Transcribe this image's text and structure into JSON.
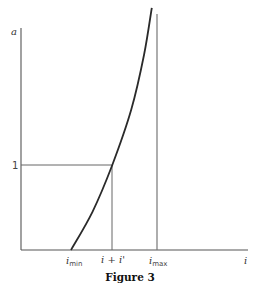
{
  "chart_data": {
    "type": "line",
    "title": "",
    "caption": "Figure 3",
    "xlabel": "i",
    "ylabel": "a",
    "grid": false,
    "legend": "none",
    "x_ticks": [
      {
        "label": "i",
        "sub": "min",
        "value": "i_min"
      },
      {
        "label": "i + i'",
        "sub": "",
        "value": "i + i'"
      },
      {
        "label": "i",
        "sub": "max",
        "value": "i_max"
      }
    ],
    "y_ticks": [
      {
        "label": "1",
        "value": 1
      }
    ],
    "series": [
      {
        "name": "a(i)",
        "description": "Increasing convex curve starting at a=0 at i_min, passing through a=1 at i+i', asymptotic to vertical line at i_max",
        "points": [
          {
            "x": 0.0,
            "y": 0.0
          },
          {
            "x": 0.25,
            "y": 0.45
          },
          {
            "x": 0.48,
            "y": 1.0
          },
          {
            "x": 0.7,
            "y": 1.65
          },
          {
            "x": 0.85,
            "y": 2.3
          },
          {
            "x": 0.94,
            "y": 2.85
          }
        ]
      }
    ],
    "x_range_normalized": [
      0,
      1
    ],
    "x_note": "normalized: 0 = i_min, 0.48 = i + i', 1 = i_max (vertical asymptote)",
    "reference_lines": [
      {
        "type": "horizontal",
        "y": 1,
        "from": "a-axis",
        "to": "i + i'"
      },
      {
        "type": "vertical",
        "x": "i + i'",
        "from": 0,
        "to": 1
      },
      {
        "type": "vertical-asymptote",
        "x": "i_max"
      }
    ]
  }
}
